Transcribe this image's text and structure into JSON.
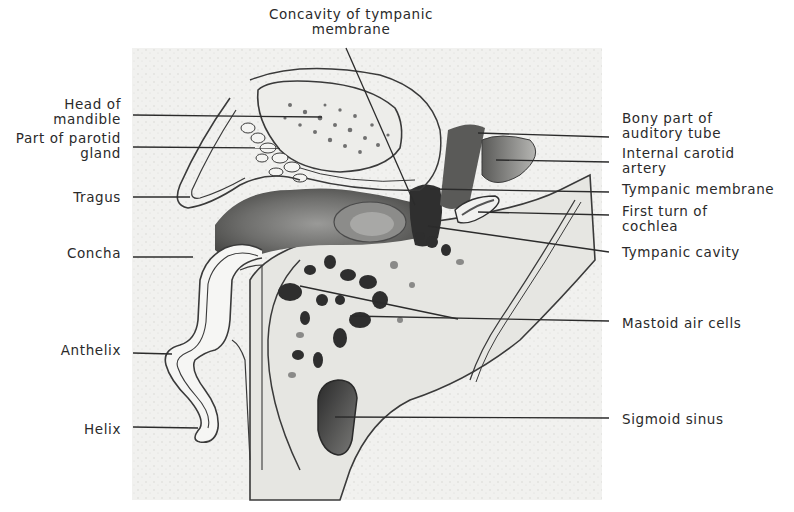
{
  "figure": {
    "panel": {
      "x": 132,
      "y": 48,
      "width": 470,
      "height": 452,
      "background": "#f1f1ef"
    },
    "ink_color": "#2b2b2b",
    "bone_color": "#e9e9e6",
    "dark_color": "#3a3a3a"
  },
  "labels": {
    "top": [
      {
        "id": "concavity-of-tympanic-membrane",
        "text": "Concavity of tympanic\nmembrane",
        "x": 262,
        "y": 7,
        "w": 178,
        "align": "center",
        "line": [
          [
            346,
            48
          ],
          [
            415,
            205
          ]
        ]
      }
    ],
    "left": [
      {
        "id": "head-of-mandible",
        "text": "Head of\nmandible",
        "x": 0,
        "y": 97,
        "w": 121,
        "align": "right",
        "line": [
          [
            133,
            115
          ],
          [
            322,
            117
          ]
        ]
      },
      {
        "id": "part-of-parotid-gland",
        "text": "Part of parotid\ngland",
        "x": 0,
        "y": 131,
        "w": 121,
        "align": "right",
        "line": [
          [
            133,
            147
          ],
          [
            280,
            148
          ]
        ]
      },
      {
        "id": "tragus",
        "text": "Tragus",
        "x": 0,
        "y": 190,
        "w": 121,
        "align": "right",
        "line": [
          [
            133,
            197
          ],
          [
            190,
            197
          ]
        ]
      },
      {
        "id": "concha",
        "text": "Concha",
        "x": 0,
        "y": 246,
        "w": 121,
        "align": "right",
        "line": [
          [
            133,
            257
          ],
          [
            193,
            257
          ]
        ]
      },
      {
        "id": "anthelix",
        "text": "Anthelix",
        "x": 0,
        "y": 343,
        "w": 121,
        "align": "right",
        "line": [
          [
            133,
            353
          ],
          [
            172,
            354
          ]
        ]
      },
      {
        "id": "helix",
        "text": "Helix",
        "x": 0,
        "y": 422,
        "w": 121,
        "align": "right",
        "line": [
          [
            133,
            427
          ],
          [
            198,
            428
          ]
        ]
      }
    ],
    "right": [
      {
        "id": "bony-part-of-auditory-tube",
        "text": "Bony part of\nauditory tube",
        "x": 622,
        "y": 111,
        "w": 170,
        "align": "left",
        "line": [
          [
            609,
            137
          ],
          [
            478,
            133
          ]
        ]
      },
      {
        "id": "internal-carotid-artery",
        "text": "Internal carotid\nartery",
        "x": 622,
        "y": 146,
        "w": 170,
        "align": "left",
        "line": [
          [
            609,
            162
          ],
          [
            496,
            160
          ]
        ]
      },
      {
        "id": "tympanic-membrane",
        "text": "Tympanic membrane",
        "x": 622,
        "y": 182,
        "w": 170,
        "align": "left",
        "line": [
          [
            609,
            192
          ],
          [
            430,
            189
          ]
        ]
      },
      {
        "id": "first-turn-of-cochlea",
        "text": "First turn of\ncochlea",
        "x": 622,
        "y": 204,
        "w": 170,
        "align": "left",
        "line": [
          [
            609,
            215
          ],
          [
            478,
            212
          ]
        ]
      },
      {
        "id": "tympanic-cavity",
        "text": "Tympanic cavity",
        "x": 622,
        "y": 245,
        "w": 170,
        "align": "left",
        "line": [
          [
            609,
            252
          ],
          [
            428,
            226
          ]
        ]
      },
      {
        "id": "mastoid-air-cells",
        "text": "Mastoid air cells",
        "x": 622,
        "y": 316,
        "w": 170,
        "align": "left",
        "line": [
          [
            609,
            321
          ],
          [
            350,
            316
          ]
        ],
        "line2": [
          [
            458,
            319
          ],
          [
            300,
            286
          ]
        ]
      },
      {
        "id": "sigmoid-sinus",
        "text": "Sigmoid sinus",
        "x": 622,
        "y": 412,
        "w": 170,
        "align": "left",
        "line": [
          [
            609,
            418
          ],
          [
            335,
            417
          ]
        ]
      }
    ]
  }
}
